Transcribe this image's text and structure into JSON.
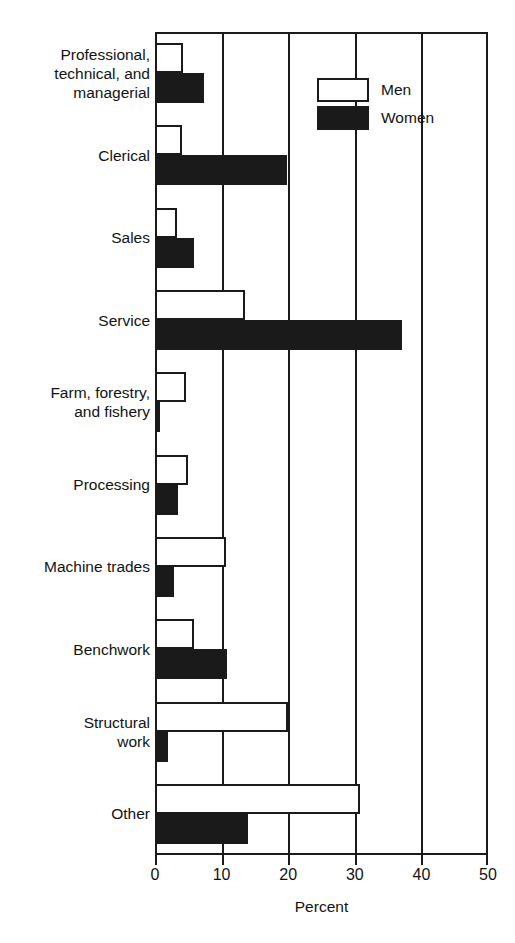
{
  "chart_data": {
    "type": "bar",
    "orientation": "horizontal",
    "title": "",
    "xlabel": "Percent",
    "ylabel": "",
    "xlim": [
      0,
      50
    ],
    "xticks": [
      0,
      10,
      20,
      30,
      40,
      50
    ],
    "xtick_labels": [
      "0",
      "10",
      "20",
      "30",
      "40",
      "50"
    ],
    "grid": "vertical",
    "legend_position": "top-right",
    "categories": [
      "Professional,\ntechnical, and\nmanagerial",
      "Clerical",
      "Sales",
      "Service",
      "Farm, forestry,\nand fishery",
      "Processing",
      "Machine trades",
      "Benchwork",
      "Structural\nwork",
      "Other"
    ],
    "series": [
      {
        "name": "Men",
        "color": "#ffffff",
        "values": [
          4.2,
          4.0,
          3.3,
          13.5,
          4.7,
          5.0,
          10.7,
          5.8,
          20.0,
          30.8
        ]
      },
      {
        "name": "Women",
        "color": "#1a1a1a",
        "values": [
          7.3,
          19.8,
          5.9,
          37.1,
          0.7,
          3.4,
          2.9,
          10.8,
          2.0,
          13.9
        ]
      }
    ]
  },
  "legend": {
    "items": [
      {
        "label": "Men",
        "swatch": "men"
      },
      {
        "label": "Women",
        "swatch": "women"
      }
    ]
  },
  "axis": {
    "x_title": "Percent"
  }
}
